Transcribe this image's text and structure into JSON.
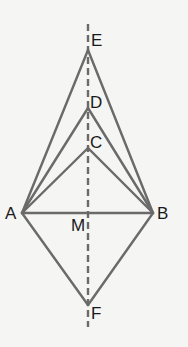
{
  "diagram": {
    "type": "geometry-figure",
    "colors": {
      "background": "#f5f5f4",
      "line": "#6a6a6a",
      "axis": "#6a6a6a",
      "label": "#1a1a1a"
    },
    "points": {
      "A": {
        "label": "A",
        "x": 22,
        "y": 213
      },
      "B": {
        "label": "B",
        "x": 153,
        "y": 213
      },
      "C": {
        "label": "C",
        "x": 88,
        "y": 148
      },
      "D": {
        "label": "D",
        "x": 88,
        "y": 108
      },
      "E": {
        "label": "E",
        "x": 88,
        "y": 50
      },
      "F": {
        "label": "F",
        "x": 88,
        "y": 305
      },
      "M": {
        "label": "M",
        "x": 88,
        "y": 213
      }
    },
    "segments": [
      [
        "A",
        "B"
      ],
      [
        "A",
        "C"
      ],
      [
        "B",
        "C"
      ],
      [
        "A",
        "D"
      ],
      [
        "B",
        "D"
      ],
      [
        "A",
        "E"
      ],
      [
        "B",
        "E"
      ],
      [
        "A",
        "F"
      ],
      [
        "B",
        "F"
      ]
    ],
    "axis_of_symmetry": {
      "style": "dashed",
      "x": 88,
      "y1": 24,
      "y2": 327
    }
  }
}
